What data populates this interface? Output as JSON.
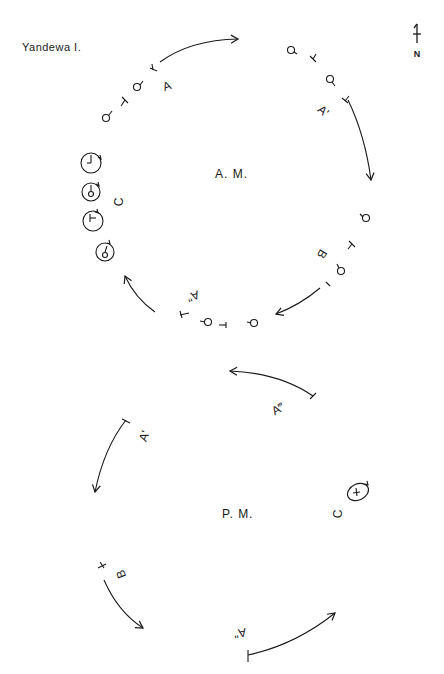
{
  "title": "Yandewa I.",
  "north_label": "N",
  "am": {
    "label": "A. M.",
    "segments": [
      {
        "id": "A",
        "label": "A"
      },
      {
        "id": "A-prime",
        "label": "A'"
      },
      {
        "id": "B",
        "label": "B"
      },
      {
        "id": "A-double-prime",
        "label": "A\""
      },
      {
        "id": "C",
        "label": "C"
      }
    ]
  },
  "pm": {
    "label": "P. M.",
    "segments": [
      {
        "id": "A-triple-prime",
        "label": "A‴"
      },
      {
        "id": "A-prime",
        "label": "A'"
      },
      {
        "id": "C",
        "label": "C"
      },
      {
        "id": "B",
        "label": "B"
      },
      {
        "id": "A-double-prime",
        "label": "A\""
      }
    ]
  },
  "colors": {
    "ink": "#1a1a1a",
    "paper": "#ffffff"
  }
}
